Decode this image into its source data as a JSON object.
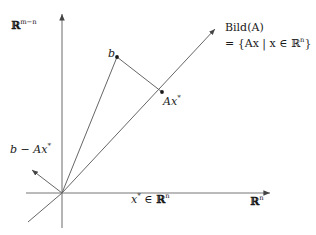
{
  "figure": {
    "background": "#ffffff",
    "line_color": "#555555",
    "text_color": "#1a1a1a",
    "width": 316,
    "height": 235
  },
  "axes": {
    "vertical": {
      "label_prefix": "ℝ",
      "label_exponent": "m−n",
      "x": 62,
      "top_y": 12,
      "bottom_y": 228
    },
    "horizontal": {
      "label": "ℝ",
      "label_exponent": "n",
      "y": 193,
      "left_x": 26,
      "right_x": 272
    }
  },
  "labels": {
    "domain_point": "x",
    "domain_point_star": "*",
    "domain_point_member": " ∈ ",
    "domain_space": "ℝ",
    "domain_space_exponent": "n",
    "vector_b": "b",
    "projection": "Ax",
    "projection_star": "*",
    "residual": "b − Ax",
    "residual_star": "*",
    "image_title": "Bild(A)",
    "image_set": "= {Ax | x ∈ ℝ",
    "image_set_exponent": "n",
    "image_set_close": "}"
  },
  "geometry": {
    "origin": {
      "x": 62,
      "y": 193
    },
    "point_b": {
      "x": 117,
      "y": 57
    },
    "point_axstar": {
      "x": 162,
      "y": 92
    },
    "image_ray_tip": {
      "x": 218,
      "y": 26
    },
    "image_ray_back": {
      "x": 28,
      "y": 222
    },
    "residual_arrow_tip": {
      "x": 29,
      "y": 167
    }
  }
}
